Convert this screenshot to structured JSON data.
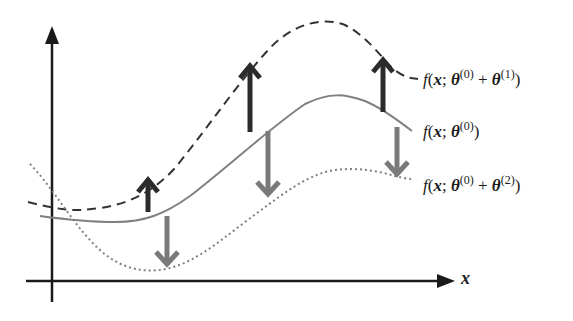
{
  "diagram": {
    "title": "",
    "axes": {
      "x_label": "x",
      "y_label": ""
    },
    "curves": [
      {
        "id": "base",
        "style": "solid",
        "color": "#808080",
        "label": {
          "fn": "f",
          "arg": "x",
          "sep": ";",
          "theta": "θ",
          "sup1": "(0)",
          "plus": "",
          "theta2": "",
          "sup2": ""
        }
      },
      {
        "id": "plus1",
        "style": "dashed",
        "color": "#333333",
        "label": {
          "fn": "f",
          "arg": "x",
          "sep": ";",
          "theta": "θ",
          "sup1": "(0)",
          "plus": "+",
          "theta2": "θ",
          "sup2": "(1)"
        }
      },
      {
        "id": "plus2",
        "style": "dotted",
        "color": "#808080",
        "label": {
          "fn": "f",
          "arg": "x",
          "sep": ";",
          "theta": "θ",
          "sup1": "(0)",
          "plus": "+",
          "theta2": "θ",
          "sup2": "(2)"
        }
      }
    ],
    "arrows": [
      {
        "direction": "up",
        "color": "#2b2b2b",
        "x": 148
      },
      {
        "direction": "up",
        "color": "#2b2b2b",
        "x": 250
      },
      {
        "direction": "up",
        "color": "#2b2b2b",
        "x": 383
      },
      {
        "direction": "down",
        "color": "#7a7a7a",
        "x": 167
      },
      {
        "direction": "down",
        "color": "#7a7a7a",
        "x": 268
      },
      {
        "direction": "down",
        "color": "#7a7a7a",
        "x": 397
      }
    ],
    "colors": {
      "axis": "#1a1a1a",
      "up_arrow": "#2b2b2b",
      "down_arrow": "#7a7a7a"
    }
  }
}
